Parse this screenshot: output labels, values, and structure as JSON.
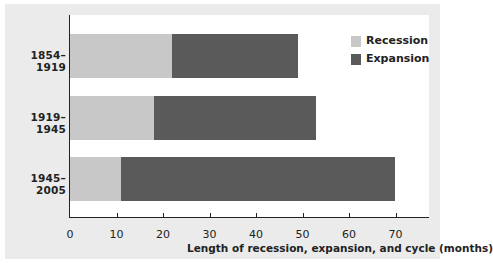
{
  "chart_data": {
    "type": "bar",
    "orientation": "horizontal",
    "stacked": true,
    "title": "",
    "xlabel": "Length of recession, expansion, and cycle (months)",
    "ylabel": "",
    "categories": [
      "1854–1919",
      "1919–1945",
      "1945–2005"
    ],
    "series": [
      {
        "name": "Recession",
        "color": "#c8c8c8",
        "values": [
          22,
          18,
          11
        ]
      },
      {
        "name": "Expansion",
        "color": "#5a5a5a",
        "values": [
          27,
          35,
          59
        ]
      }
    ],
    "cycle_totals": [
      49,
      53,
      70
    ],
    "xlim": [
      0,
      77
    ],
    "xticks": [
      0,
      10,
      20,
      30,
      40,
      50,
      60,
      70
    ],
    "grid": false,
    "legend_position": "upper right"
  },
  "legend": {
    "items": [
      {
        "label": "Recession",
        "color": "#c8c8c8"
      },
      {
        "label": "Expansion",
        "color": "#5a5a5a"
      }
    ]
  },
  "axis": {
    "ticks": [
      "0",
      "10",
      "20",
      "30",
      "40",
      "50",
      "60",
      "70"
    ],
    "xlabel": "Length of recession, expansion, and cycle (months)"
  }
}
